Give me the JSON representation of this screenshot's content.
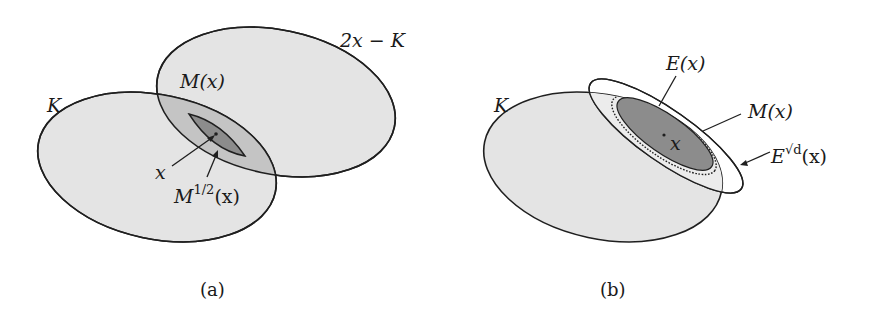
{
  "colors": {
    "light_fill": "#e4e4e4",
    "mid_fill": "#c4c4c4",
    "dark_fill": "#8c8c8c",
    "stroke": "#1f1f1f"
  },
  "panel_a": {
    "caption": "(a)",
    "labels": {
      "K": "K",
      "reflection": "2x − K",
      "M": "M(x)",
      "x": "x",
      "M_half_base": "M",
      "M_half_sup": "1/2",
      "M_half_arg": "(x)"
    }
  },
  "panel_b": {
    "caption": "(b)",
    "labels": {
      "K": "K",
      "E": "E(x)",
      "M": "M(x)",
      "x": "x",
      "Esqrt_base": "E",
      "Esqrt_sup": "√d",
      "Esqrt_arg": "(x)"
    }
  }
}
